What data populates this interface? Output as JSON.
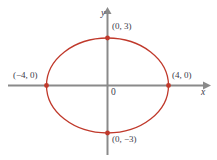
{
  "figure": {
    "type": "coordinate-graph",
    "background_color": "#ffffff"
  },
  "axes": {
    "x_label": "x",
    "y_label": "y",
    "origin_label": "0",
    "color": "#8a8a8a",
    "x_arrow_icon": "arrow-right-icon",
    "y_arrow_icon": "arrow-up-icon"
  },
  "curve": {
    "color": "#c0392b",
    "point_color": "#c0392b"
  },
  "labels": {
    "top": "(0, 3)",
    "bottom": "(0, −3)",
    "left": "(−4, 0)",
    "right": "(4, 0)"
  },
  "chart_data": {
    "type": "scatter",
    "title": "",
    "xlabel": "x",
    "ylabel": "y",
    "curve_type": "ellipse",
    "equation": "x^2/16 + y^2/9 = 1",
    "center": [
      0,
      0
    ],
    "semi_major_axis_a": 4,
    "semi_minor_axis_b": 3,
    "orientation": "horizontal",
    "xlim": [
      -5.2,
      5.6
    ],
    "ylim": [
      -4.7,
      4.7
    ],
    "grid": false,
    "legend": null,
    "marked_points": [
      {
        "label": "(0, 3)",
        "x": 0,
        "y": 3
      },
      {
        "label": "(4, 0)",
        "x": 4,
        "y": 0
      },
      {
        "label": "(0, −3)",
        "x": 0,
        "y": -3
      },
      {
        "label": "(−4, 0)",
        "x": -4,
        "y": 0
      }
    ],
    "series": [
      {
        "name": "ellipse",
        "x": [
          4.0,
          3.86,
          3.46,
          2.83,
          2.0,
          1.04,
          0.0,
          -1.04,
          -2.0,
          -2.83,
          -3.46,
          -3.86,
          -4.0,
          -3.86,
          -3.46,
          -2.83,
          -2.0,
          -1.04,
          0.0,
          1.04,
          2.0,
          2.83,
          3.46,
          3.86,
          4.0
        ],
        "y": [
          0.0,
          0.78,
          1.5,
          2.12,
          2.6,
          2.9,
          3.0,
          2.9,
          2.6,
          2.12,
          1.5,
          0.78,
          0.0,
          -0.78,
          -1.5,
          -2.12,
          -2.6,
          -2.9,
          -3.0,
          -2.9,
          -2.6,
          -2.12,
          -1.5,
          -0.78,
          0.0
        ]
      }
    ]
  }
}
